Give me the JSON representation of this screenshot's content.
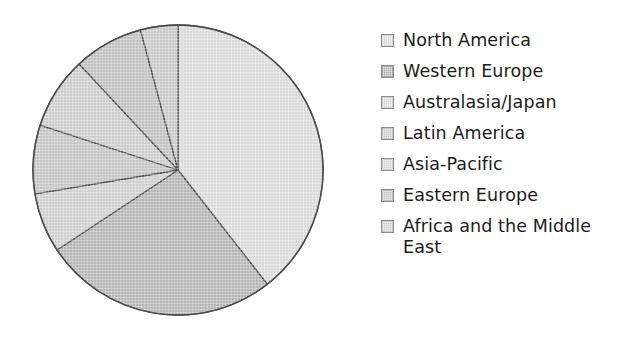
{
  "chart_data": {
    "type": "pie",
    "title": "",
    "subtitle": "",
    "xlabel": "",
    "ylabel": "",
    "grid": false,
    "legend_position": "right",
    "start_angle_deg": 0,
    "direction": "clockwise",
    "center": {
      "x": 178,
      "y": 170
    },
    "radius": 145,
    "outline_color": "#4a4a4a",
    "categories": [
      "North America",
      "Western Europe",
      "Australasia/Japan",
      "Latin America",
      "Asia-Pacific",
      "Eastern Europe",
      "Africa and the Middle East"
    ],
    "values": [
      39.4,
      26.3,
      6.7,
      7.6,
      8.1,
      7.8,
      4.1
    ],
    "value_unit": "percent",
    "angles_deg": [
      142,
      94.5,
      24,
      27.5,
      29,
      28,
      15
    ],
    "slice_colors": [
      "#dadada",
      "#b5b5b5",
      "#cfcfcf",
      "#c4c4c4",
      "#cccccc",
      "#c0c0c0",
      "#c8c8c8"
    ],
    "slices": [
      {
        "label": "North America",
        "value": 39.4,
        "start_deg": 0,
        "end_deg": 142,
        "color": "#dadada"
      },
      {
        "label": "Western Europe",
        "value": 26.3,
        "start_deg": 142,
        "end_deg": 236.5,
        "color": "#b5b5b5"
      },
      {
        "label": "Australasia/Japan",
        "value": 6.7,
        "start_deg": 236.5,
        "end_deg": 260.5,
        "color": "#cfcfcf"
      },
      {
        "label": "Latin America",
        "value": 7.6,
        "start_deg": 260.5,
        "end_deg": 288,
        "color": "#c4c4c4"
      },
      {
        "label": "Asia-Pacific",
        "value": 8.1,
        "start_deg": 288,
        "end_deg": 317,
        "color": "#cccccc"
      },
      {
        "label": "Eastern Europe",
        "value": 7.8,
        "start_deg": 317,
        "end_deg": 345,
        "color": "#c0c0c0"
      },
      {
        "label": "Africa and the Middle East",
        "value": 4.1,
        "start_deg": 345,
        "end_deg": 360,
        "color": "#c8c8c8"
      }
    ]
  },
  "legend": {
    "items": [
      {
        "label": "North America",
        "swatch_color": "#d8d8d8"
      },
      {
        "label": "Western Europe",
        "swatch_color": "#a8a8a8"
      },
      {
        "label": "Australasia/Japan",
        "swatch_color": "#d2d2d2"
      },
      {
        "label": "Latin America",
        "swatch_color": "#c6c6c6"
      },
      {
        "label": "Asia-Pacific",
        "swatch_color": "#cfcfcf"
      },
      {
        "label": "Eastern Europe",
        "swatch_color": "#bfbfbf"
      },
      {
        "label": "Africa and the Middle East",
        "swatch_color": "#cacaca"
      }
    ]
  }
}
